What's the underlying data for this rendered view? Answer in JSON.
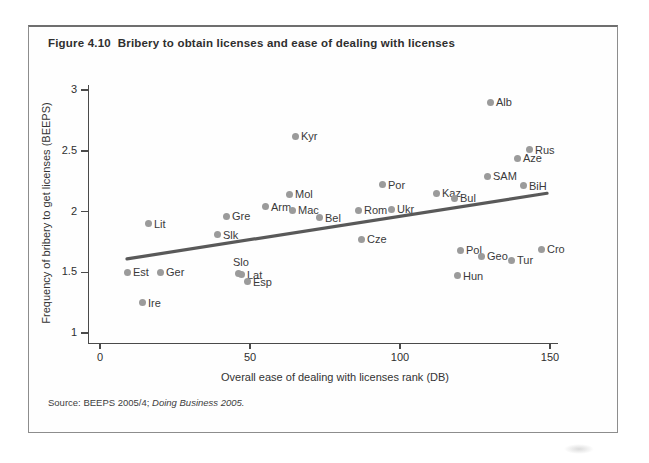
{
  "figure": {
    "source_prefix": "Source: BEEPS 2005/4; ",
    "source_italic": "Doing Business 2005."
  },
  "chart_data": {
    "type": "scatter",
    "title": "Figure 4.10  Bribery to obtain licenses and ease of dealing with licenses",
    "xlabel": "Overall ease of dealing with licenses rank (DB)",
    "ylabel": "Frequency of bribery to get licenses (BEEPS)",
    "xlim": [
      0,
      150
    ],
    "ylim": [
      1,
      3
    ],
    "x_ticks": [
      0,
      50,
      100,
      150
    ],
    "y_ticks": [
      1,
      1.5,
      2,
      2.5,
      3
    ],
    "grid": false,
    "legend": "none",
    "point_color": "#9b9b9b",
    "trend_color": "#595959",
    "points": [
      {
        "name": "Est",
        "x": 9,
        "y": 1.5
      },
      {
        "name": "Ire",
        "x": 14,
        "y": 1.25
      },
      {
        "name": "Lit",
        "x": 16,
        "y": 1.9
      },
      {
        "name": "Ger",
        "x": 20,
        "y": 1.5
      },
      {
        "name": "Slk",
        "x": 39,
        "y": 1.81
      },
      {
        "name": "Gre",
        "x": 42,
        "y": 1.96
      },
      {
        "name": "Slo",
        "x": 46,
        "y": 1.49,
        "label_pos": "above"
      },
      {
        "name": "Lat",
        "x": 47,
        "y": 1.48
      },
      {
        "name": "Esp",
        "x": 49,
        "y": 1.42
      },
      {
        "name": "Arm",
        "x": 55,
        "y": 2.04
      },
      {
        "name": "Mol",
        "x": 63,
        "y": 2.14
      },
      {
        "name": "Mac",
        "x": 64,
        "y": 2.01
      },
      {
        "name": "Kyr",
        "x": 65,
        "y": 2.62
      },
      {
        "name": "Bel",
        "x": 73,
        "y": 1.95
      },
      {
        "name": "Rom",
        "x": 86,
        "y": 2.01
      },
      {
        "name": "Cze",
        "x": 87,
        "y": 1.77
      },
      {
        "name": "Por",
        "x": 94,
        "y": 2.22
      },
      {
        "name": "Ukr",
        "x": 97,
        "y": 2.02
      },
      {
        "name": "Kaz",
        "x": 112,
        "y": 2.15
      },
      {
        "name": "Bul",
        "x": 118,
        "y": 2.11
      },
      {
        "name": "Hun",
        "x": 119,
        "y": 1.47
      },
      {
        "name": "Pol",
        "x": 120,
        "y": 1.68
      },
      {
        "name": "Geo",
        "x": 127,
        "y": 1.63
      },
      {
        "name": "SAM",
        "x": 129,
        "y": 2.29
      },
      {
        "name": "Alb",
        "x": 130,
        "y": 2.9
      },
      {
        "name": "Tur",
        "x": 137,
        "y": 1.6
      },
      {
        "name": "Aze",
        "x": 139,
        "y": 2.44
      },
      {
        "name": "BiH",
        "x": 141,
        "y": 2.21
      },
      {
        "name": "Rus",
        "x": 143,
        "y": 2.51
      },
      {
        "name": "Cro",
        "x": 147,
        "y": 1.69
      }
    ],
    "trend_line": {
      "x1": 9,
      "y1": 1.61,
      "x2": 149,
      "y2": 2.15
    }
  }
}
